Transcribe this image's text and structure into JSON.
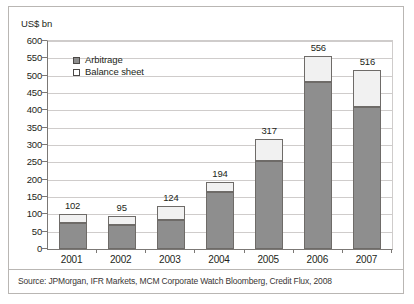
{
  "chart_data": {
    "type": "bar",
    "subtype": "stacked-bar",
    "title": "",
    "xlabel": "",
    "ylabel": "US$ bn",
    "ylim": [
      0,
      600
    ],
    "ytick_step": 50,
    "yticks": [
      600,
      550,
      500,
      450,
      400,
      350,
      300,
      250,
      200,
      150,
      100,
      50,
      0
    ],
    "grid": true,
    "legend_position": "top-left-inside",
    "categories": [
      "2001",
      "2002",
      "2003",
      "2004",
      "2005",
      "2006",
      "2007"
    ],
    "series": [
      {
        "name": "Arbitrage",
        "color": "#8e8e8e",
        "values": [
          75,
          68,
          85,
          165,
          255,
          483,
          411
        ]
      },
      {
        "name": "Balance sheet",
        "color": "#f1f1f1",
        "values": [
          27,
          27,
          39,
          29,
          62,
          73,
          105
        ]
      }
    ],
    "totals": [
      102,
      95,
      124,
      194,
      317,
      556,
      516
    ],
    "total_labels": [
      "102",
      "95",
      "124",
      "194",
      "317",
      "556",
      "516"
    ]
  },
  "legend": {
    "items": [
      {
        "label": "Arbitrage",
        "swatch": "filled-gray-square"
      },
      {
        "label": "Balance sheet",
        "swatch": "empty-white-square"
      }
    ]
  },
  "footer": {
    "source": "Source: JPMorgan, IFR Markets, MCM Corporate Watch Bloomberg, Credit Flux, 2008"
  }
}
